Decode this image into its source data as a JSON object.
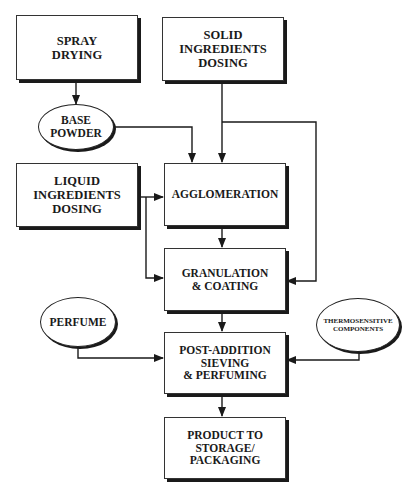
{
  "diagram": {
    "title": "",
    "nodes": [
      {
        "id": "spray_drying",
        "shape": "box",
        "label": "SPRAY\nDRYING"
      },
      {
        "id": "solid_dosing",
        "shape": "box",
        "label": "SOLID\nINGREDIENTS\nDOSING"
      },
      {
        "id": "base_powder",
        "shape": "ellipse",
        "label": "BASE\nPOWDER"
      },
      {
        "id": "liquid_dosing",
        "shape": "box",
        "label": "LIQUID\nINGREDIENTS\nDOSING"
      },
      {
        "id": "agglomeration",
        "shape": "box",
        "label": "AGGLOMERATION"
      },
      {
        "id": "granulation",
        "shape": "box",
        "label": "GRANULATION\n& COATING"
      },
      {
        "id": "perfume",
        "shape": "ellipse",
        "label": "PERFUME"
      },
      {
        "id": "thermosensitive",
        "shape": "ellipse",
        "label": "THERMOSENSITIVE\nCOMPONENTS"
      },
      {
        "id": "post_addition",
        "shape": "box",
        "label": "POST-ADDITION\nSIEVING\n& PERFUMING"
      },
      {
        "id": "product",
        "shape": "box",
        "label": "PRODUCT TO\nSTORAGE/\nPACKAGING"
      }
    ],
    "edges": [
      {
        "from": "spray_drying",
        "to": "base_powder"
      },
      {
        "from": "base_powder",
        "to": "agglomeration"
      },
      {
        "from": "solid_dosing",
        "to": "agglomeration"
      },
      {
        "from": "solid_dosing",
        "to": "granulation"
      },
      {
        "from": "liquid_dosing",
        "to": "agglomeration"
      },
      {
        "from": "liquid_dosing",
        "to": "granulation"
      },
      {
        "from": "agglomeration",
        "to": "granulation"
      },
      {
        "from": "granulation",
        "to": "post_addition"
      },
      {
        "from": "perfume",
        "to": "post_addition"
      },
      {
        "from": "thermosensitive",
        "to": "post_addition"
      },
      {
        "from": "post_addition",
        "to": "product"
      }
    ]
  }
}
